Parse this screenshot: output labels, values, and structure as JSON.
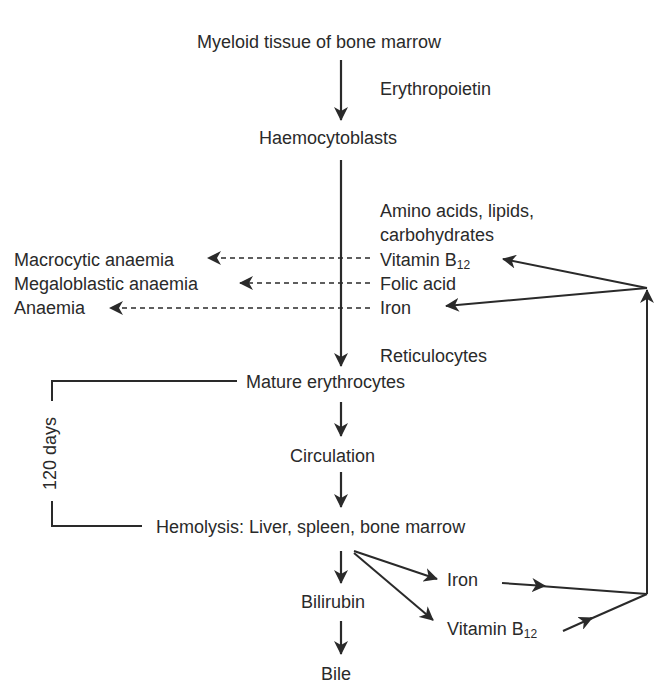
{
  "diagram": {
    "type": "flowchart",
    "nodes": {
      "myeloid": "Myeloid tissue of bone marrow",
      "erythropoietin": "Erythropoietin",
      "haemocytoblasts": "Haemocytoblasts",
      "nutrients_line1": "Amino acids, lipids,",
      "nutrients_line2": "carbohydrates",
      "vitamin_b12_top": "Vitamin B",
      "vitamin_b12_top_sub": "12",
      "folic_acid": "Folic acid",
      "iron_top": "Iron",
      "macrocytic": "Macrocytic anaemia",
      "megaloblastic": "Megaloblastic anaemia",
      "anaemia": "Anaemia",
      "reticulocytes": "Reticulocytes",
      "mature": "Mature erythrocytes",
      "circulation": "Circulation",
      "hemolysis": "Hemolysis: Liver, spleen, bone marrow",
      "bilirubin": "Bilirubin",
      "bile": "Bile",
      "iron_bottom": "Iron",
      "vitamin_b12_bottom": "Vitamin B",
      "vitamin_b12_bottom_sub": "12",
      "lifespan": "120 days"
    },
    "edges": [
      {
        "from": "Myeloid tissue of bone marrow",
        "to": "Haemocytoblasts",
        "label": "Erythropoietin",
        "style": "solid"
      },
      {
        "from": "Haemocytoblasts",
        "to": "Mature erythrocytes",
        "label": "Reticulocytes",
        "style": "solid"
      },
      {
        "from": "Vitamin B12",
        "to": "Macrocytic anaemia",
        "style": "dashed",
        "meaning": "deficiency"
      },
      {
        "from": "Folic acid",
        "to": "Megaloblastic anaemia",
        "style": "dashed",
        "meaning": "deficiency"
      },
      {
        "from": "Iron",
        "to": "Anaemia",
        "style": "dashed",
        "meaning": "deficiency"
      },
      {
        "from": "Mature erythrocytes",
        "to": "Circulation",
        "style": "solid"
      },
      {
        "from": "Circulation",
        "to": "Hemolysis: Liver, spleen, bone marrow",
        "style": "solid"
      },
      {
        "from": "Hemolysis: Liver, spleen, bone marrow",
        "to": "Bilirubin",
        "style": "solid"
      },
      {
        "from": "Bilirubin",
        "to": "Bile",
        "style": "solid"
      },
      {
        "from": "Hemolysis: Liver, spleen, bone marrow",
        "to": "Iron (recycled)",
        "style": "solid"
      },
      {
        "from": "Hemolysis: Liver, spleen, bone marrow",
        "to": "Vitamin B12 (recycled)",
        "style": "solid"
      },
      {
        "from": "Iron (recycled)",
        "to": "Iron",
        "style": "solid",
        "via": "right-side return line"
      },
      {
        "from": "Vitamin B12 (recycled)",
        "to": "Vitamin B12",
        "style": "solid",
        "via": "right-side return line"
      }
    ],
    "bracket": {
      "from": "Mature erythrocytes",
      "to": "Hemolysis: Liver, spleen, bone marrow",
      "label": "120 days"
    }
  },
  "colors": {
    "ink": "#2a2a2a",
    "background": "#ffffff"
  }
}
